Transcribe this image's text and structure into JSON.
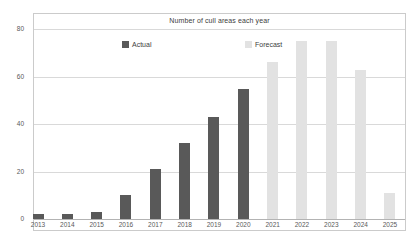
{
  "theme": {
    "background": "#ffffff",
    "border_color": "#cbcbcb",
    "gridline_color": "#d9d9d9",
    "axis_color": "#b3b3b3",
    "text_color": "#595959",
    "actual_color": "#595959",
    "forecast_color": "#e2e2e2"
  },
  "chart_data": {
    "type": "bar",
    "title": "Number of cull areas each year",
    "categories": [
      "2013",
      "2014",
      "2015",
      "2016",
      "2017",
      "2018",
      "2019",
      "2020",
      "2021",
      "2022",
      "2023",
      "2024",
      "2025"
    ],
    "series": [
      {
        "name": "Actual",
        "color": "#595959",
        "values": [
          2,
          2,
          3,
          10,
          21,
          32,
          43,
          55,
          null,
          null,
          null,
          null,
          null
        ]
      },
      {
        "name": "Forecast",
        "color": "#e2e2e2",
        "values": [
          null,
          null,
          null,
          null,
          null,
          null,
          null,
          null,
          66,
          75,
          75,
          63,
          11
        ]
      }
    ],
    "xlabel": "",
    "ylabel": "",
    "ylim": [
      0,
      80
    ],
    "yticks": [
      0,
      20,
      40,
      60,
      80
    ],
    "grid": true,
    "legend_position": "top-inside"
  }
}
